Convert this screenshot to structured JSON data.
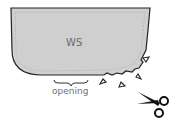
{
  "diagram": {
    "piece_label": "WS",
    "opening_label": "opening",
    "elements": {
      "fabric_piece": "rounded-corner fabric panel with dashed stitch line",
      "notches": "triangular clipped notches along curved seam allowance",
      "tool": "scissors-icon"
    },
    "colors": {
      "fabric_fill": "#cfcfcf",
      "outline": "#222222",
      "label_text": "#6b6b6b",
      "scissors": "#111111"
    }
  }
}
